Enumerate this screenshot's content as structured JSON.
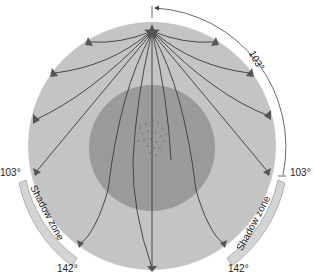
{
  "diagram": {
    "labels": {
      "top_angle": "103°",
      "left_103": "103°",
      "right_103": "103°",
      "left_142": "142°",
      "right_142": "142°",
      "shadow_left": "Shadow zone",
      "shadow_right": "Shadow zone"
    },
    "colors": {
      "mantle": "#c4c4c4",
      "core": "#9a9a9a",
      "shadow_band": "#d4d4d4",
      "rays": "#3a3a3a",
      "background": "#ffffff"
    },
    "icons": {
      "epicenter": "star-icon",
      "arrows": "triangle-arrow-icon"
    }
  }
}
